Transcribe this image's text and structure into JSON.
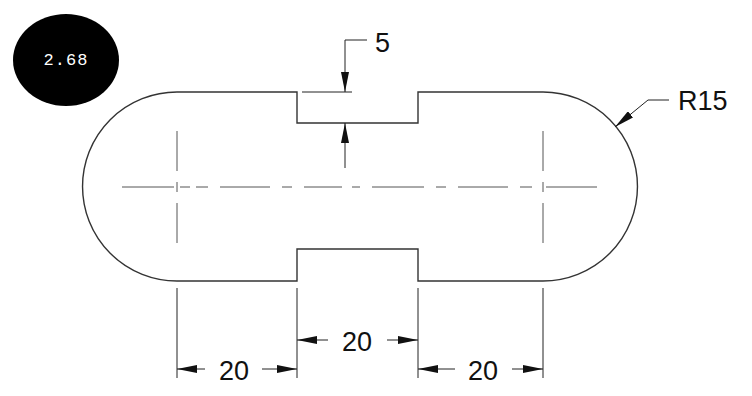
{
  "badge": {
    "label": "2.68",
    "background": "#000000",
    "text_color": "#ffffff"
  },
  "dimensions": {
    "notch_depth": "5",
    "radius": "R15",
    "left_length": "20",
    "middle_length": "20",
    "right_length": "20"
  },
  "colors": {
    "outline": "#333333",
    "centerline": "#555555",
    "dimension": "#222222",
    "background": "#ffffff"
  }
}
